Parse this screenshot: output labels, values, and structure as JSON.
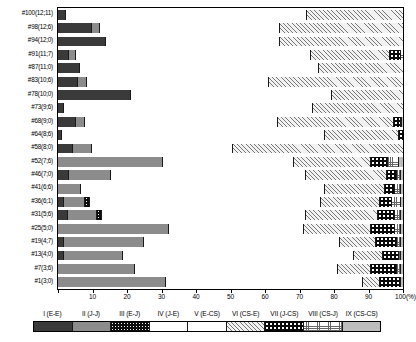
{
  "chart_data": {
    "type": "bar",
    "orientation": "horizontal",
    "stacked": true,
    "normalized_percent": true,
    "title": "",
    "xlabel": "(%)",
    "ylabel": "",
    "xlim": [
      0,
      100
    ],
    "grid": false,
    "legend_position": "bottom",
    "xticks": [
      0,
      10,
      20,
      30,
      40,
      50,
      60,
      70,
      80,
      90,
      100
    ],
    "xticklabels": [
      "0",
      "10",
      "20",
      "30",
      "40",
      "50",
      "60",
      "70",
      "80",
      "90",
      "100"
    ],
    "xunit_label": "(%)",
    "categories": [
      "#100(12;11)",
      "#98(12;6)",
      "#94(12;0)",
      "#91(11;7)",
      "#87(11;0)",
      "#83(10;6)",
      "#78(10;0)",
      "#73(9;6)",
      "#68(9;0)",
      "#64(8;6)",
      "#58(8;0)",
      "#52(7;6)",
      "#46(7;0)",
      "#41(6;6)",
      "#36(6;1)",
      "#31(5;6)",
      "#25(5;0)",
      "#19(4;7)",
      "#13(4;0)",
      "#7(3;6)",
      "#1(3;0)"
    ],
    "series": [
      {
        "name": "I (E-E)",
        "key": "I",
        "pattern": "dark-gray-solid",
        "values": [
          2.0,
          9.5,
          13.5,
          3.0,
          6.0,
          5.5,
          21.0,
          1.5,
          5.0,
          1.0,
          4.0,
          0.0,
          3.0,
          0.0,
          1.5,
          2.5,
          0.0,
          1.5,
          1.5,
          0.0,
          0.0
        ]
      },
      {
        "name": "II (J-J)",
        "key": "II",
        "pattern": "medium-gray-solid",
        "values": [
          0.0,
          2.5,
          0.0,
          2.0,
          0.0,
          2.5,
          0.0,
          0.0,
          2.5,
          0.0,
          5.5,
          30.0,
          12.0,
          6.5,
          6.0,
          8.5,
          32.0,
          23.0,
          17.0,
          22.0,
          31.0
        ]
      },
      {
        "name": "III (E-J)",
        "key": "III",
        "pattern": "black-white-dots",
        "values": [
          0.0,
          0.0,
          0.0,
          0.0,
          0.0,
          0.0,
          0.0,
          0.0,
          0.0,
          0.0,
          0.0,
          0.0,
          0.0,
          0.0,
          1.5,
          1.5,
          0.0,
          0.0,
          0.0,
          0.0,
          0.0
        ]
      },
      {
        "name": "IV (J-E)",
        "key": "IV",
        "pattern": "white",
        "values": [
          70.0,
          52.0,
          50.5,
          68.0,
          69.5,
          53.0,
          58.0,
          72.0,
          56.0,
          76.0,
          41.0,
          38.0,
          56.5,
          70.5,
          67.0,
          59.0,
          39.0,
          57.0,
          67.0,
          59.0,
          57.0
        ]
      },
      {
        "name": "V (E-CS)",
        "key": "V",
        "pattern": "horizontal-lines",
        "values": [
          0.0,
          0.0,
          0.0,
          0.0,
          0.0,
          0.0,
          0.0,
          0.0,
          0.0,
          0.0,
          0.0,
          0.0,
          0.0,
          0.0,
          0.0,
          0.0,
          0.0,
          0.0,
          0.0,
          0.0,
          0.0
        ]
      },
      {
        "name": "VI (CS-E)",
        "key": "VI",
        "pattern": "diagonal-hatch",
        "values": [
          28.0,
          36.0,
          36.0,
          23.0,
          24.5,
          39.0,
          21.0,
          26.5,
          33.5,
          21.5,
          49.5,
          22.5,
          23.5,
          17.5,
          17.0,
          21.0,
          19.5,
          10.5,
          8.5,
          9.5,
          5.0
        ]
      },
      {
        "name": "VII (J-CS)",
        "key": "VII",
        "pattern": "black-white-large-dots",
        "values": [
          0.0,
          0.0,
          0.0,
          3.0,
          0.0,
          0.0,
          0.0,
          0.0,
          2.0,
          1.5,
          0.0,
          5.0,
          3.0,
          3.0,
          3.5,
          5.0,
          7.0,
          6.0,
          4.5,
          7.5,
          6.0
        ]
      },
      {
        "name": "VIII (CS-J)",
        "key": "VIII",
        "pattern": "grid-crosshatch",
        "values": [
          0.0,
          0.0,
          0.0,
          1.0,
          0.0,
          0.0,
          0.0,
          0.0,
          0.5,
          0.0,
          0.0,
          3.0,
          1.0,
          1.5,
          2.5,
          1.5,
          1.5,
          1.0,
          0.5,
          1.0,
          0.0
        ]
      },
      {
        "name": "IX (CS-CS)",
        "key": "IX",
        "pattern": "light-gray-solid",
        "values": [
          0.0,
          0.0,
          0.0,
          0.0,
          0.0,
          0.0,
          0.0,
          0.0,
          0.5,
          0.0,
          0.0,
          1.5,
          1.0,
          1.0,
          1.0,
          1.0,
          1.0,
          1.0,
          1.0,
          1.0,
          1.0
        ]
      }
    ]
  },
  "legend": {
    "entries": [
      {
        "label": "I (E-E)",
        "pattern_class": "p1"
      },
      {
        "label": "II (J-J)",
        "pattern_class": "p2"
      },
      {
        "label": "III (E-J)",
        "pattern_class": "p3"
      },
      {
        "label": "IV (J-E)",
        "pattern_class": "p4"
      },
      {
        "label": "V (E-CS)",
        "pattern_class": "p5"
      },
      {
        "label": "VI (CS-E)",
        "pattern_class": "p6"
      },
      {
        "label": "VII (J-CS)",
        "pattern_class": "p7"
      },
      {
        "label": "VIII (CS-J)",
        "pattern_class": "p8"
      },
      {
        "label": "IX (CS-CS)",
        "pattern_class": "p9"
      }
    ]
  },
  "colors": {
    "axis": "#000000",
    "series_I": "#3a3a3a",
    "series_II": "#8c8c8c",
    "series_III": "#0d0d0d",
    "series_IV": "#ffffff",
    "series_V": "#ffffff",
    "series_VI": "#f2f2f2",
    "series_VII": "#0a0a0a",
    "series_VIII": "#ffffff",
    "series_IX": "#bdbdbd"
  }
}
